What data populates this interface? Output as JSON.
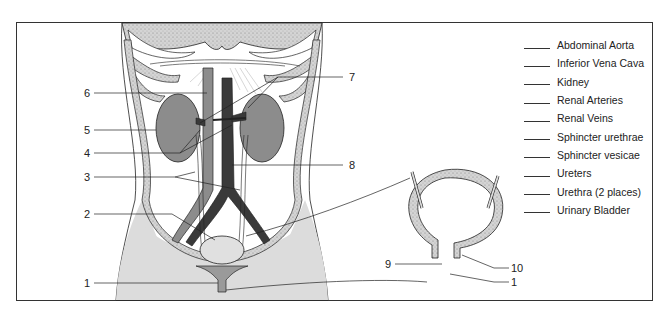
{
  "diagram": {
    "colors": {
      "frame": "#333333",
      "organ_gray": "#8c8c8c",
      "vein_dark": "#3a3a3a",
      "body_fill": "#d9d9d9",
      "bone_fill": "#cfcfcf",
      "line": "#222222"
    },
    "main_view_labels": [
      {
        "number": "1",
        "x": 86,
        "y": 283
      },
      {
        "number": "2",
        "x": 86,
        "y": 214
      },
      {
        "number": "3",
        "x": 86,
        "y": 177
      },
      {
        "number": "4",
        "x": 86,
        "y": 153
      },
      {
        "number": "5",
        "x": 86,
        "y": 130
      },
      {
        "number": "6",
        "x": 86,
        "y": 93
      },
      {
        "number": "7",
        "x": 351,
        "y": 77
      },
      {
        "number": "8",
        "x": 351,
        "y": 165
      }
    ],
    "bladder_view_labels": [
      {
        "number": "9",
        "x": 387,
        "y": 264
      },
      {
        "number": "10",
        "x": 517,
        "y": 268
      },
      {
        "number": "1",
        "x": 517,
        "y": 282
      }
    ],
    "answer_choices": [
      "Abdominal Aorta",
      "Inferior Vena Cava",
      "Kidney",
      "Renal Arteries",
      "Renal Veins",
      "Sphincter urethrae",
      "Sphincter vesicae",
      "Ureters",
      "Urethra (2 places)",
      "Urinary Bladder"
    ]
  }
}
